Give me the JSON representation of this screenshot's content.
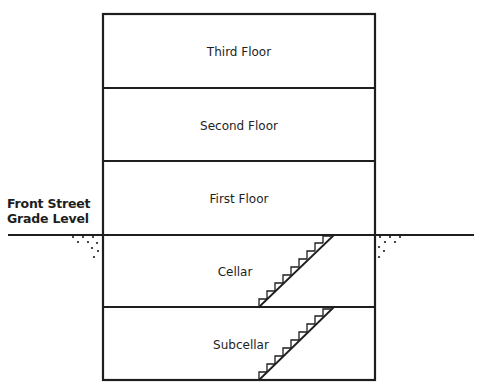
{
  "diagram": {
    "ground_label_line1": "Front Street",
    "ground_label_line2": "Grade Level",
    "floors": [
      {
        "label": "Third Floor",
        "level": "above-grade"
      },
      {
        "label": "Second Floor",
        "level": "above-grade"
      },
      {
        "label": "First Floor",
        "level": "above-grade"
      },
      {
        "label": "Cellar",
        "level": "below-grade",
        "has_stairs": true
      },
      {
        "label": "Subcellar",
        "level": "below-grade",
        "has_stairs": true
      }
    ],
    "colors": {
      "line": "#1e1e1e",
      "background": "#ffffff"
    }
  }
}
